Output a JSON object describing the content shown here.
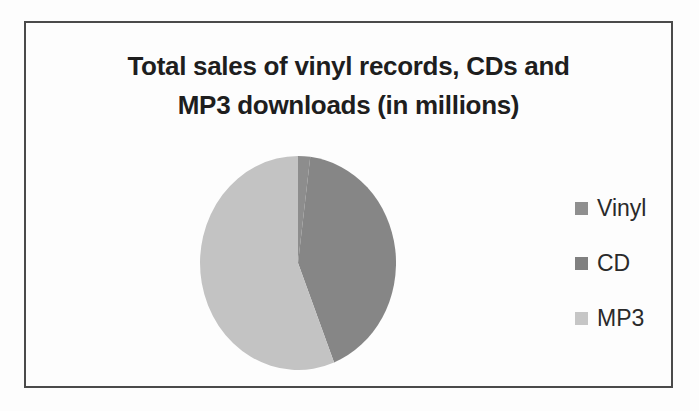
{
  "chart_frame": {
    "border_color": "#4a4a4a",
    "background_color": "#fdfdfd"
  },
  "chart_data": {
    "type": "pie",
    "title": "Total sales of vinyl records, CDs and MP3 downloads (in millions)",
    "title_lines": [
      "Total sales of vinyl records, CDs and",
      "MP3 downloads (in millions)"
    ],
    "legend_position": "right",
    "legend_entries": [
      "Vinyl",
      "CD",
      "MP3"
    ],
    "start_angle_deg": 0,
    "direction": "clockwise",
    "values_are_estimates": true,
    "slices": [
      {
        "label": "Vinyl",
        "percent": 2,
        "color": "#8d8d8d",
        "legend_swatch_color": "#8f8f8f"
      },
      {
        "label": "CD",
        "percent": 42,
        "color": "#868686",
        "legend_swatch_color": "#808080"
      },
      {
        "label": "MP3",
        "percent": 56,
        "color": "#c3c3c3",
        "legend_swatch_color": "#c6c6c6"
      }
    ],
    "appearance_note": "grayscale scanned print: Vinyl and CD slices appear as one dark-gray region covering about 44% of the pie (~158 degrees, from 12 o'clock clockwise); MP3 is the light-gray region covering about 56%; no numeric value labels are printed on the chart"
  }
}
